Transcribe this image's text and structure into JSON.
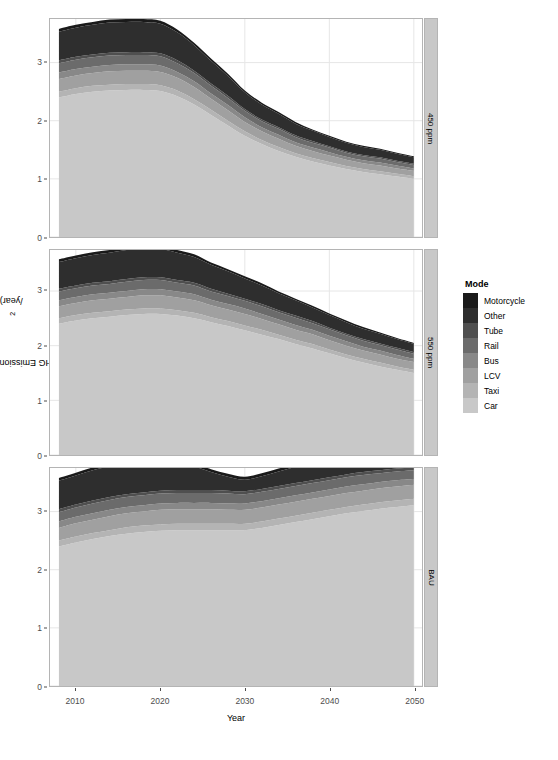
{
  "chart_data": {
    "type": "area",
    "title": "",
    "xlabel": "Year",
    "ylabel": "GHG Emissions (Mt CO2/year)",
    "ylabel_prefix": "GHG Emissions (Mt CO",
    "ylabel_sub": "2",
    "ylabel_suffix": "/year)",
    "stacked": true,
    "grid": true,
    "legend_position": "right",
    "legend_title": "Mode",
    "xlim": [
      2008,
      2050
    ],
    "ylim": [
      0,
      3.75
    ],
    "xticks": [
      2010,
      2020,
      2030,
      2040,
      2050
    ],
    "yticks": [
      0,
      1,
      2,
      3
    ],
    "x": [
      2008,
      2010,
      2012,
      2014,
      2016,
      2018,
      2020,
      2022,
      2024,
      2026,
      2028,
      2030,
      2032,
      2034,
      2036,
      2038,
      2040,
      2042,
      2044,
      2046,
      2048,
      2050
    ],
    "series_order_bottom_to_top": [
      "Car",
      "Taxi",
      "LCV",
      "Bus",
      "Rail",
      "Tube",
      "Other",
      "Motorcycle"
    ],
    "colors": {
      "Motorcycle": "#1a1a1a",
      "Other": "#2e2e2e",
      "Tube": "#4f4f4f",
      "Rail": "#6b6b6b",
      "Bus": "#888888",
      "LCV": "#a0a0a0",
      "Taxi": "#b4b4b4",
      "Car": "#c8c8c8"
    },
    "panels": [
      {
        "label": "450 ppm",
        "series": [
          {
            "name": "Car",
            "values": [
              2.4,
              2.46,
              2.5,
              2.52,
              2.53,
              2.53,
              2.51,
              2.42,
              2.28,
              2.1,
              1.92,
              1.74,
              1.6,
              1.48,
              1.38,
              1.3,
              1.23,
              1.17,
              1.12,
              1.08,
              1.04,
              1.0
            ]
          },
          {
            "name": "Taxi",
            "values": [
              0.1,
              0.1,
              0.1,
              0.1,
              0.1,
              0.1,
              0.1,
              0.1,
              0.09,
              0.09,
              0.08,
              0.08,
              0.07,
              0.07,
              0.06,
              0.06,
              0.06,
              0.05,
              0.05,
              0.05,
              0.05,
              0.05
            ]
          },
          {
            "name": "LCV",
            "values": [
              0.22,
              0.22,
              0.22,
              0.23,
              0.23,
              0.23,
              0.23,
              0.22,
              0.21,
              0.19,
              0.18,
              0.16,
              0.15,
              0.14,
              0.13,
              0.12,
              0.11,
              0.11,
              0.1,
              0.1,
              0.09,
              0.09
            ]
          },
          {
            "name": "Bus",
            "values": [
              0.11,
              0.11,
              0.11,
              0.11,
              0.11,
              0.11,
              0.11,
              0.1,
              0.1,
              0.09,
              0.09,
              0.08,
              0.07,
              0.07,
              0.06,
              0.06,
              0.06,
              0.05,
              0.05,
              0.05,
              0.05,
              0.04
            ]
          },
          {
            "name": "Rail",
            "values": [
              0.16,
              0.16,
              0.16,
              0.16,
              0.16,
              0.16,
              0.16,
              0.15,
              0.14,
              0.13,
              0.12,
              0.11,
              0.1,
              0.1,
              0.09,
              0.08,
              0.08,
              0.07,
              0.07,
              0.07,
              0.06,
              0.06
            ]
          },
          {
            "name": "Tube",
            "values": [
              0.05,
              0.05,
              0.05,
              0.05,
              0.05,
              0.05,
              0.05,
              0.05,
              0.04,
              0.04,
              0.04,
              0.03,
              0.03,
              0.03,
              0.03,
              0.03,
              0.02,
              0.02,
              0.02,
              0.02,
              0.02,
              0.02
            ]
          },
          {
            "name": "Other",
            "values": [
              0.49,
              0.5,
              0.51,
              0.52,
              0.52,
              0.52,
              0.51,
              0.48,
              0.44,
              0.39,
              0.34,
              0.29,
              0.26,
              0.23,
              0.2,
              0.18,
              0.16,
              0.15,
              0.14,
              0.13,
              0.12,
              0.11
            ]
          },
          {
            "name": "Motorcycle",
            "values": [
              0.05,
              0.05,
              0.05,
              0.05,
              0.05,
              0.05,
              0.05,
              0.05,
              0.04,
              0.04,
              0.04,
              0.03,
              0.03,
              0.03,
              0.03,
              0.02,
              0.02,
              0.02,
              0.02,
              0.02,
              0.02,
              0.02
            ]
          }
        ],
        "totals": [
          3.58,
          3.65,
          3.7,
          3.74,
          3.75,
          3.75,
          3.72,
          3.57,
          3.34,
          3.07,
          2.81,
          2.52,
          2.31,
          2.15,
          1.98,
          1.85,
          1.74,
          1.64,
          1.57,
          1.52,
          1.45,
          1.39
        ]
      },
      {
        "label": "550 ppm",
        "series": [
          {
            "name": "Car",
            "values": [
              2.4,
              2.46,
              2.5,
              2.53,
              2.56,
              2.58,
              2.58,
              2.55,
              2.5,
              2.43,
              2.36,
              2.28,
              2.2,
              2.12,
              2.03,
              1.95,
              1.86,
              1.77,
              1.69,
              1.62,
              1.56,
              1.5
            ]
          },
          {
            "name": "Taxi",
            "values": [
              0.1,
              0.1,
              0.1,
              0.1,
              0.1,
              0.1,
              0.1,
              0.1,
              0.1,
              0.09,
              0.09,
              0.09,
              0.09,
              0.08,
              0.08,
              0.08,
              0.07,
              0.07,
              0.07,
              0.07,
              0.06,
              0.06
            ]
          },
          {
            "name": "LCV",
            "values": [
              0.22,
              0.22,
              0.23,
              0.23,
              0.23,
              0.24,
              0.24,
              0.23,
              0.23,
              0.22,
              0.21,
              0.21,
              0.2,
              0.19,
              0.18,
              0.18,
              0.17,
              0.16,
              0.15,
              0.15,
              0.14,
              0.14
            ]
          },
          {
            "name": "Bus",
            "values": [
              0.11,
              0.11,
              0.11,
              0.11,
              0.11,
              0.11,
              0.11,
              0.11,
              0.11,
              0.1,
              0.1,
              0.1,
              0.09,
              0.09,
              0.09,
              0.08,
              0.08,
              0.08,
              0.07,
              0.07,
              0.07,
              0.06
            ]
          },
          {
            "name": "Rail",
            "values": [
              0.16,
              0.16,
              0.16,
              0.16,
              0.17,
              0.17,
              0.17,
              0.16,
              0.16,
              0.15,
              0.15,
              0.14,
              0.14,
              0.13,
              0.13,
              0.12,
              0.12,
              0.11,
              0.11,
              0.1,
              0.1,
              0.09
            ]
          },
          {
            "name": "Tube",
            "values": [
              0.05,
              0.05,
              0.05,
              0.05,
              0.05,
              0.05,
              0.05,
              0.05,
              0.05,
              0.05,
              0.04,
              0.04,
              0.04,
              0.04,
              0.04,
              0.04,
              0.03,
              0.03,
              0.03,
              0.03,
              0.03,
              0.03
            ]
          },
          {
            "name": "Other",
            "values": [
              0.49,
              0.5,
              0.51,
              0.52,
              0.53,
              0.53,
              0.52,
              0.5,
              0.47,
              0.44,
              0.41,
              0.37,
              0.34,
              0.31,
              0.28,
              0.25,
              0.23,
              0.21,
              0.19,
              0.18,
              0.16,
              0.15
            ]
          },
          {
            "name": "Motorcycle",
            "values": [
              0.05,
              0.05,
              0.05,
              0.05,
              0.05,
              0.05,
              0.05,
              0.05,
              0.05,
              0.04,
              0.04,
              0.04,
              0.04,
              0.03,
              0.03,
              0.03,
              0.03,
              0.03,
              0.03,
              0.02,
              0.02,
              0.02
            ]
          }
        ],
        "totals": [
          3.58,
          3.65,
          3.71,
          3.75,
          3.8,
          3.83,
          3.82,
          3.75,
          3.67,
          3.52,
          3.4,
          3.27,
          3.14,
          2.99,
          2.86,
          2.73,
          2.59,
          2.46,
          2.34,
          2.24,
          2.14,
          2.05
        ]
      },
      {
        "label": "BAU",
        "series": [
          {
            "name": "Car",
            "values": [
              2.4,
              2.47,
              2.53,
              2.58,
              2.62,
              2.65,
              2.67,
              2.68,
              2.68,
              2.68,
              2.68,
              2.68,
              2.72,
              2.77,
              2.82,
              2.87,
              2.92,
              2.97,
              3.01,
              3.05,
              3.08,
              3.11
            ]
          },
          {
            "name": "Taxi",
            "values": [
              0.1,
              0.1,
              0.1,
              0.1,
              0.11,
              0.11,
              0.11,
              0.11,
              0.11,
              0.11,
              0.11,
              0.11,
              0.11,
              0.11,
              0.11,
              0.11,
              0.11,
              0.11,
              0.11,
              0.11,
              0.11,
              0.11
            ]
          },
          {
            "name": "LCV",
            "values": [
              0.22,
              0.23,
              0.23,
              0.24,
              0.24,
              0.24,
              0.25,
              0.25,
              0.25,
              0.25,
              0.24,
              0.24,
              0.24,
              0.24,
              0.24,
              0.24,
              0.24,
              0.24,
              0.24,
              0.24,
              0.24,
              0.24
            ]
          },
          {
            "name": "Bus",
            "values": [
              0.11,
              0.11,
              0.11,
              0.11,
              0.11,
              0.11,
              0.11,
              0.11,
              0.11,
              0.11,
              0.11,
              0.11,
              0.11,
              0.11,
              0.11,
              0.11,
              0.11,
              0.11,
              0.11,
              0.11,
              0.11,
              0.1
            ]
          },
          {
            "name": "Rail",
            "values": [
              0.16,
              0.16,
              0.17,
              0.17,
              0.17,
              0.17,
              0.17,
              0.17,
              0.17,
              0.17,
              0.17,
              0.16,
              0.16,
              0.16,
              0.16,
              0.16,
              0.16,
              0.16,
              0.16,
              0.15,
              0.15,
              0.15
            ]
          },
          {
            "name": "Tube",
            "values": [
              0.05,
              0.05,
              0.05,
              0.05,
              0.05,
              0.05,
              0.05,
              0.05,
              0.05,
              0.05,
              0.05,
              0.05,
              0.05,
              0.05,
              0.05,
              0.05,
              0.05,
              0.05,
              0.05,
              0.05,
              0.05,
              0.05
            ]
          },
          {
            "name": "Other",
            "values": [
              0.49,
              0.5,
              0.52,
              0.53,
              0.54,
              0.54,
              0.54,
              0.5,
              0.41,
              0.31,
              0.24,
              0.2,
              0.22,
              0.25,
              0.28,
              0.31,
              0.34,
              0.36,
              0.38,
              0.39,
              0.4,
              0.41
            ]
          },
          {
            "name": "Motorcycle",
            "values": [
              0.05,
              0.05,
              0.05,
              0.05,
              0.05,
              0.05,
              0.05,
              0.05,
              0.05,
              0.05,
              0.05,
              0.05,
              0.05,
              0.05,
              0.05,
              0.05,
              0.05,
              0.05,
              0.05,
              0.05,
              0.05,
              0.05
            ]
          }
        ],
        "totals": [
          3.58,
          3.67,
          3.76,
          3.83,
          3.89,
          3.92,
          3.95,
          3.92,
          3.83,
          3.73,
          3.65,
          3.6,
          3.66,
          3.74,
          3.82,
          3.9,
          3.98,
          4.05,
          4.11,
          4.15,
          4.19,
          4.22
        ]
      }
    ],
    "legend_entries": [
      {
        "label": "Motorcycle",
        "color": "#1a1a1a"
      },
      {
        "label": "Other",
        "color": "#2e2e2e"
      },
      {
        "label": "Tube",
        "color": "#4f4f4f"
      },
      {
        "label": "Rail",
        "color": "#6b6b6b"
      },
      {
        "label": "Bus",
        "color": "#888888"
      },
      {
        "label": "LCV",
        "color": "#a0a0a0"
      },
      {
        "label": "Taxi",
        "color": "#b4b4b4"
      },
      {
        "label": "Car",
        "color": "#c8c8c8"
      }
    ],
    "panel_strip_bg": "#c8c8c8",
    "grid_color": "#e6e6e6",
    "panel_border_color": "#b4b4b4",
    "axis_text_color": "#4d4d4d"
  }
}
